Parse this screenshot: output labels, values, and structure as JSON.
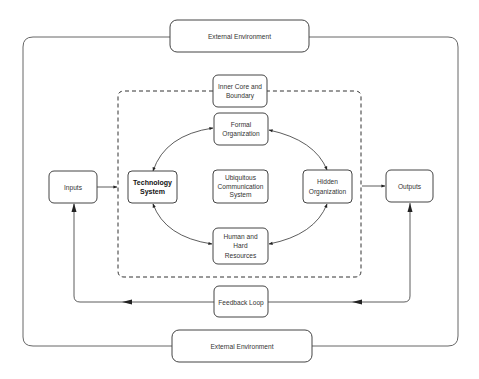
{
  "diagram": {
    "type": "systems-model",
    "nodes": {
      "external_top": {
        "label": "External Environment"
      },
      "external_bottom": {
        "label": "External Environment"
      },
      "inner_core": {
        "lines": [
          "Inner Core and",
          "Boundary"
        ]
      },
      "formal_org": {
        "lines": [
          "Formal",
          "Organization"
        ]
      },
      "ubiquitous": {
        "lines": [
          "Ubiquitous",
          "Communication",
          "System"
        ]
      },
      "human": {
        "lines": [
          "Human and",
          "Hard",
          "Resources"
        ]
      },
      "technology": {
        "lines": [
          "Technology",
          "System"
        ]
      },
      "hidden": {
        "lines": [
          "Hidden",
          "Organization"
        ]
      },
      "inputs": {
        "label": "Inputs"
      },
      "outputs": {
        "label": "Outputs"
      },
      "feedback": {
        "label": "Feedback Loop"
      }
    },
    "edges": [
      {
        "from": "Inputs",
        "to": "Inner Core boundary"
      },
      {
        "from": "Inner Core boundary",
        "to": "Outputs"
      },
      {
        "from": "Technology System",
        "to": "Formal Organization",
        "bidirectional": true
      },
      {
        "from": "Formal Organization",
        "to": "Hidden Organization",
        "bidirectional": true
      },
      {
        "from": "Hidden Organization",
        "to": "Human and Hard Resources",
        "bidirectional": true
      },
      {
        "from": "Human and Hard Resources",
        "to": "Technology System",
        "bidirectional": true
      },
      {
        "from": "Outputs",
        "to": "Feedback Loop"
      },
      {
        "from": "Feedback Loop",
        "to": "Inputs"
      }
    ]
  }
}
